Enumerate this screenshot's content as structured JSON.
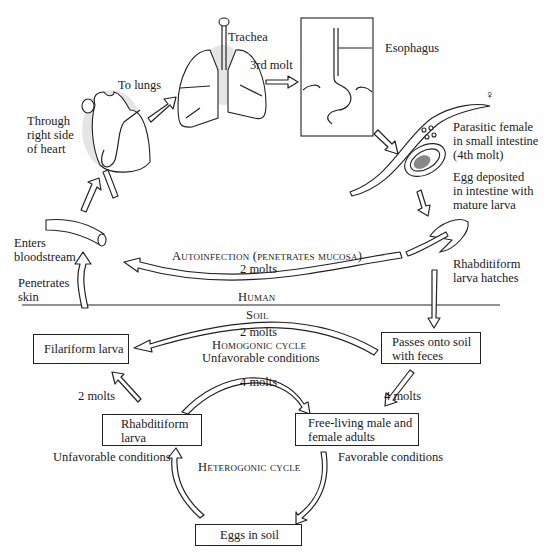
{
  "diagram": {
    "regions": {
      "human": "Human",
      "soil": "Soil"
    },
    "stages_human": {
      "enters_bloodstream": "Enters\nbloodstream",
      "penetrates_skin": "Penetrates\nskin",
      "through_heart": "Through\nright side\nof heart",
      "to_lungs": "To lungs",
      "trachea": "Trachea",
      "third_molt": "3rd molt",
      "esophagus": "Esophagus",
      "female_symbol": "♀",
      "parasitic_female": "Parasitic female\nin small intestine\n(4th molt)",
      "egg_deposited": "Egg deposited\nin intestine with\nmature larva",
      "rhabditiform_hatches": "Rhabditiform\nlarva hatches",
      "autoinfection": "Autoinfection (penetrates mucosa)",
      "autoinfection_molts": "2 molts"
    },
    "boxes": {
      "filariform": "Filariform larva",
      "passes_soil": "Passes onto soil\nwith feces",
      "rhabditiform": "Rhabditiform\nlarva",
      "free_living": "Free-living male and\nfemale adults",
      "eggs_soil": "Eggs in soil"
    },
    "soil_labels": {
      "homogonic_molts": "2 molts",
      "homogonic_cycle": "Homogonic cycle",
      "homogonic_conditions": "Unfavorable conditions",
      "four_molts_center": "4 molts",
      "four_molts_right": "4 molts",
      "two_molts_left": "2 molts",
      "unfavorable_left": "Unfavorable conditions",
      "favorable_right": "Favorable conditions",
      "heterogonic_cycle": "Heterogonic cycle"
    }
  }
}
